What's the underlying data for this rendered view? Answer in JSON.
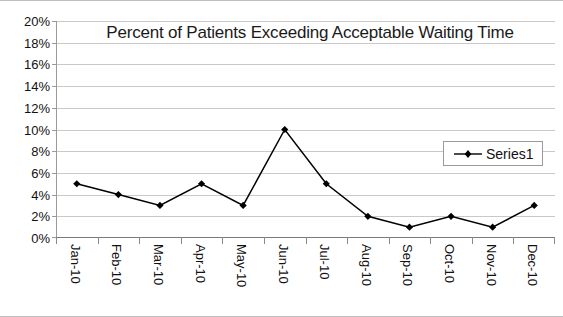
{
  "chart_data": {
    "type": "line",
    "title": "Percent of Patients Exceeding Acceptable Waiting Time",
    "xlabel": "",
    "ylabel": "",
    "categories": [
      "Jan-10",
      "Feb-10",
      "Mar-10",
      "Apr-10",
      "May-10",
      "Jun-10",
      "Jul-10",
      "Aug-10",
      "Sep-10",
      "Oct-10",
      "Nov-10",
      "Dec-10"
    ],
    "series": [
      {
        "name": "Series1",
        "values": [
          5,
          4,
          3,
          5,
          3,
          10,
          5,
          2,
          1,
          2,
          1,
          3
        ],
        "color": "#000000",
        "marker": "diamond"
      }
    ],
    "ylim": [
      0,
      20
    ],
    "ytick_labels": [
      "20%",
      "18%",
      "16%",
      "14%",
      "12%",
      "10%",
      "8%",
      "6%",
      "4%",
      "2%",
      "0%"
    ],
    "ytick_values": [
      20,
      18,
      16,
      14,
      12,
      10,
      8,
      6,
      4,
      2,
      0
    ],
    "ytick_step": 2,
    "value_unit": "%",
    "grid": "horizontal",
    "legend_position": "inside-right",
    "legend_entries": [
      "Series1"
    ],
    "plot_background": "#ffffff",
    "gridline_color": "#c9c9c9",
    "axis_color": "#8a8a8a",
    "xlabel_rotation": 90
  }
}
